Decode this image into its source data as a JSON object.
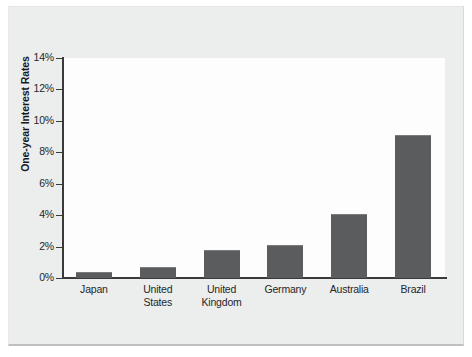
{
  "chart_data": {
    "type": "bar",
    "title": "",
    "subtitle": "",
    "xlabel": "",
    "ylabel": "One-year Interest Rates",
    "categories": [
      "Japan",
      "United States",
      "United Kingdom",
      "Germany",
      "Australia",
      "Brazil"
    ],
    "category_lines": [
      [
        "Japan"
      ],
      [
        "United",
        "States"
      ],
      [
        "United",
        "Kingdom"
      ],
      [
        "Germany"
      ],
      [
        "Australia"
      ],
      [
        "Brazil"
      ]
    ],
    "values": [
      0.4,
      0.7,
      1.8,
      2.1,
      4.1,
      9.1
    ],
    "ylim": [
      0,
      14
    ],
    "ytick_values": [
      0,
      2,
      4,
      6,
      8,
      10,
      12,
      14
    ],
    "ytick_labels": [
      "0%",
      "2%",
      "4%",
      "6%",
      "8%",
      "10%",
      "12%",
      "14%"
    ],
    "grid": false,
    "legend": null,
    "legend_position": "none",
    "bar_color": "#5b5c5e",
    "axis_color": "#3a3a3a",
    "plot_background": "#fdfdfd",
    "page_background": "#eceded"
  }
}
